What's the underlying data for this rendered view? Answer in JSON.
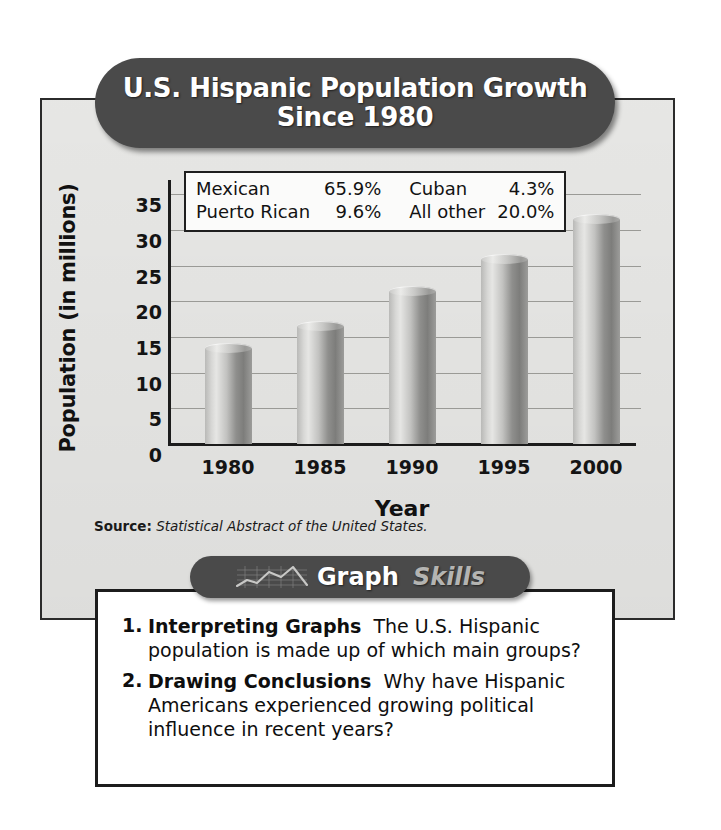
{
  "title": {
    "line1": "U.S. Hispanic Population Growth",
    "line2": "Since 1980"
  },
  "chart_data": {
    "type": "bar",
    "title": "U.S. Hispanic Population Growth Since 1980",
    "xlabel": "Year",
    "ylabel": "Population (in millions)",
    "categories": [
      "1980",
      "1985",
      "1990",
      "1995",
      "2000"
    ],
    "values": [
      13.5,
      16.5,
      21.5,
      26.0,
      31.5
    ],
    "ylim": [
      0,
      37
    ],
    "yticks": [
      "0",
      "5",
      "10",
      "15",
      "20",
      "25",
      "30",
      "35"
    ],
    "ytick_values": [
      0,
      5,
      10,
      15,
      20,
      25,
      30,
      35
    ],
    "grid": true,
    "legend_position": "inside-top",
    "bar_style": "3d-cylinder",
    "bar_color": "#b0b0ae"
  },
  "legend": {
    "rows": [
      {
        "label_left": "Mexican",
        "value_left": "65.9%",
        "label_right": "Cuban",
        "value_right": "4.3%"
      },
      {
        "label_left": "Puerto Rican",
        "value_left": "9.6%",
        "label_right": "All other",
        "value_right": "20.0%"
      }
    ]
  },
  "source": {
    "key": "Source:",
    "value": "Statistical Abstract of the United States."
  },
  "skills_banner": {
    "word1": "Graph",
    "word2": "Skills",
    "icon": "line-chart-icon"
  },
  "questions": [
    {
      "number": "1.",
      "term": "Interpreting Graphs",
      "text": "The U.S. Hispanic population is made up of which main groups?"
    },
    {
      "number": "2.",
      "term": "Drawing Conclusions",
      "text": "Why have Hispanic Americans experienced growing political influence in recent years?"
    }
  ],
  "colors": {
    "banner": "#4a4a4a",
    "panel": "#e9e9e7",
    "ink": "#141414",
    "gridline": "#9a9a96"
  }
}
